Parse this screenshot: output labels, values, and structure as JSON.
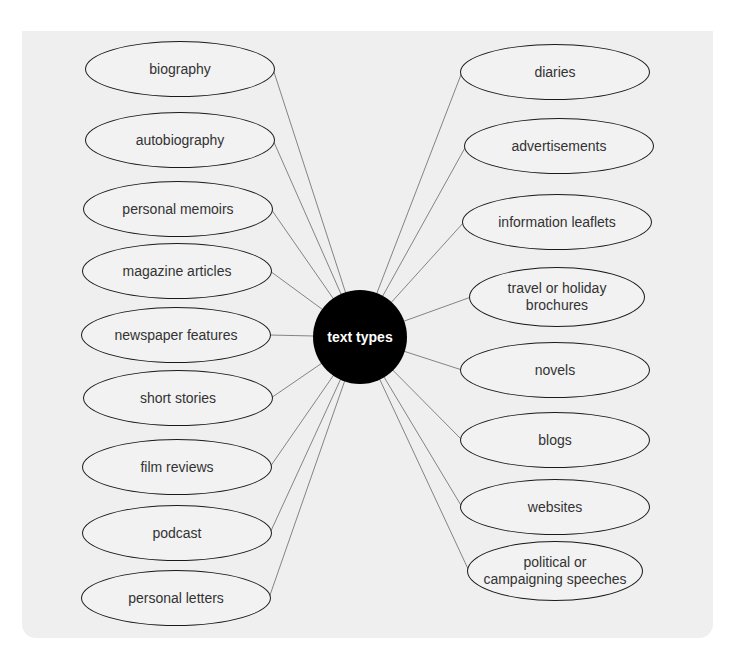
{
  "diagram": {
    "center": {
      "label": "text types",
      "x": 360,
      "y": 337,
      "r": 47
    },
    "colors": {
      "panel_bg": "#efefef",
      "node_border": "#1a1a1a",
      "hub_bg": "#000000",
      "hub_text": "#ffffff",
      "line": "#777777"
    },
    "left_nodes": [
      {
        "label": "biography",
        "cx": 180,
        "cy": 69
      },
      {
        "label": "autobiography",
        "cx": 180,
        "cy": 140
      },
      {
        "label": "personal memoirs",
        "cx": 178,
        "cy": 209
      },
      {
        "label": "magazine articles",
        "cx": 177,
        "cy": 271
      },
      {
        "label": "newspaper features",
        "cx": 176,
        "cy": 335
      },
      {
        "label": "short stories",
        "cx": 178,
        "cy": 398
      },
      {
        "label": "film reviews",
        "cx": 177,
        "cy": 467
      },
      {
        "label": "podcast",
        "cx": 177,
        "cy": 533
      },
      {
        "label": "personal letters",
        "cx": 176,
        "cy": 598
      }
    ],
    "right_nodes": [
      {
        "label": "diaries",
        "cx": 555,
        "cy": 72
      },
      {
        "label": "advertisements",
        "cx": 559,
        "cy": 146
      },
      {
        "label": "information leaflets",
        "cx": 557,
        "cy": 222
      },
      {
        "label": "travel or holiday brochures",
        "cx": 557,
        "cy": 297
      },
      {
        "label": "novels",
        "cx": 555,
        "cy": 370
      },
      {
        "label": "blogs",
        "cx": 555,
        "cy": 440
      },
      {
        "label": "websites",
        "cx": 555,
        "cy": 507
      },
      {
        "label": "political or campaigning speeches",
        "cx": 555,
        "cy": 571
      }
    ]
  }
}
